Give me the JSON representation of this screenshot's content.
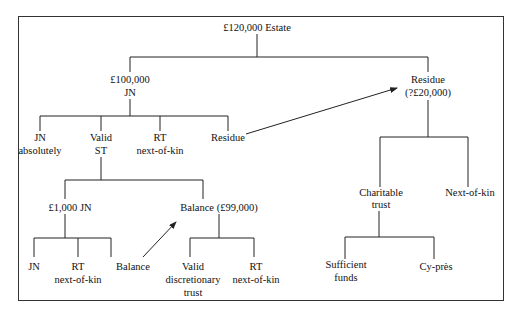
{
  "diagram": {
    "root": {
      "label": "£120,000 Estate"
    },
    "nodes": {
      "jn100k": {
        "line1": "£100,000",
        "line2": "JN"
      },
      "jn_absolutely": {
        "line1": "JN",
        "line2": "absolutely"
      },
      "valid_st": {
        "line1": "Valid",
        "line2": "ST"
      },
      "rt_nok_1": {
        "line1": "RT",
        "line2": "next-of-kin"
      },
      "residue_left": {
        "label": "Residue"
      },
      "jn1000": {
        "label": "£1,000 JN"
      },
      "balance99k": {
        "label": "Balance (£99,000)"
      },
      "jn_leaf": {
        "label": "JN"
      },
      "rt_nok_2": {
        "line1": "RT",
        "line2": "next-of-kin"
      },
      "balance_leaf": {
        "label": "Balance"
      },
      "valid_discretionary": {
        "line1": "Valid",
        "line2": "discretionary",
        "line3": "trust"
      },
      "rt_nok_3": {
        "line1": "RT",
        "line2": "next-of-kin"
      },
      "residue_right": {
        "line1": "Residue",
        "line2": "(?£20,000)"
      },
      "charitable_trust": {
        "line1": "Charitable",
        "line2": "trust"
      },
      "next_of_kin": {
        "label": "Next-of-kin"
      },
      "sufficient_funds": {
        "line1": "Sufficient",
        "line2": "funds"
      },
      "cy_pres": {
        "label": "Cy-près"
      }
    },
    "edges": [
      {
        "from": "root",
        "to": "jn100k"
      },
      {
        "from": "root",
        "to": "residue_right"
      },
      {
        "from": "jn100k",
        "to": "jn_absolutely"
      },
      {
        "from": "jn100k",
        "to": "valid_st"
      },
      {
        "from": "jn100k",
        "to": "rt_nok_1"
      },
      {
        "from": "jn100k",
        "to": "residue_left"
      },
      {
        "from": "valid_st",
        "to": "jn1000"
      },
      {
        "from": "valid_st",
        "to": "balance99k"
      },
      {
        "from": "jn1000",
        "to": "jn_leaf"
      },
      {
        "from": "jn1000",
        "to": "rt_nok_2"
      },
      {
        "from": "jn1000",
        "to": "balance_leaf"
      },
      {
        "from": "balance99k",
        "to": "valid_discretionary"
      },
      {
        "from": "balance99k",
        "to": "rt_nok_3"
      },
      {
        "from": "residue_right",
        "to": "charitable_trust"
      },
      {
        "from": "residue_right",
        "to": "next_of_kin"
      },
      {
        "from": "charitable_trust",
        "to": "sufficient_funds"
      },
      {
        "from": "charitable_trust",
        "to": "cy_pres"
      }
    ],
    "arrows": [
      {
        "from": "residue_left",
        "to": "residue_right"
      },
      {
        "from": "balance_leaf",
        "to": "balance99k"
      }
    ]
  }
}
